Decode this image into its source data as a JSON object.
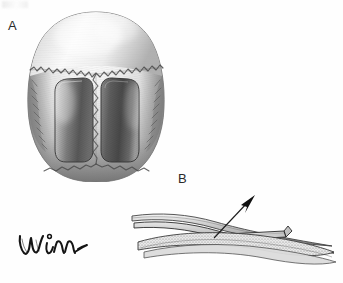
{
  "figure": {
    "kind": "anatomical-illustration",
    "medium": "grayscale pencil / airbrush rendering",
    "background_color": "#fefefe",
    "ink_color": "#2a2a2a"
  },
  "panels": [
    {
      "id": "A",
      "label": "A",
      "view": "superior (vertex) view of the skull",
      "description": "Top-down view of the cranial vault. The frontal bone occupies the upper third, the coronal suture sweeps across as an irregular serrated line, and the sagittal suture runs down the midline to the lambdoid suture at the lower pole. Two dark, rounded-rectangular parietal bone flaps are outlined bilaterally, one on each side of the sagittal suture.",
      "features": [
        "frontal bone",
        "coronal suture",
        "sagittal suture",
        "lambdoid suture",
        "left parietal bone flap",
        "right parietal bone flap",
        "temporalis shading at lateral margins"
      ]
    },
    {
      "id": "B",
      "label": "B",
      "view": "lateral cross-section through the cranial vault",
      "description": "Edge-on sectional view of the skull wall showing layered outer table, diploe and inner table as elongated tapering strips. A bone flap is hinged and elevated off the underlying vault; a slender leader line with a solid arrowhead points up and to the right to indicate the direction of elevation.",
      "features": [
        "outer table strip",
        "diploe / cancellous stippled layer",
        "inner table strip",
        "elevated bone flap",
        "elevation direction arrow"
      ]
    }
  ],
  "annotations": {
    "arrow": {
      "name": "elevation-arrow",
      "meaning": "direction of bone flap elevation",
      "direction": "up and to the right"
    }
  },
  "signature": {
    "text": "Winn",
    "style": "cursive handwritten artist signature with trailing flourish"
  },
  "colors": {
    "background": "#fefefe",
    "ink": "#2a2a2a",
    "bone_light": "#f2f2f2",
    "bone_mid": "#c9c9c9",
    "bone_shadow": "#8f8f8f",
    "flap_dark": "#5a5a5a",
    "flap_darkest": "#3c3c3c",
    "suture_line": "#4a4a4a"
  }
}
